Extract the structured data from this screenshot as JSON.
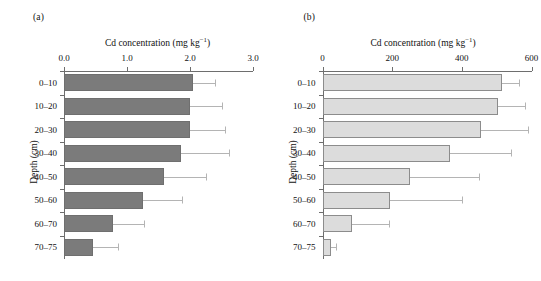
{
  "figure": {
    "axis_title_html": "Cd concentration (mg kg",
    "axis_title_sup": "−1",
    "axis_title_close": ")",
    "ylabel": "Depth (cm)",
    "depths": [
      "0–10",
      "10–20",
      "20–30",
      "30–40",
      "40–50",
      "50–60",
      "60–70",
      "70–75"
    ]
  },
  "panels": [
    {
      "letter": "(a)",
      "bar_color": "#7b7b7b",
      "border_color": "#6f6f6f",
      "tick_labels": [
        "0.0",
        "1.0",
        "2.0",
        "3.0"
      ]
    },
    {
      "letter": "(b)",
      "bar_color": "#dcdcdc",
      "border_color": "#8c8c8c",
      "tick_labels": [
        "0",
        "200",
        "400",
        "600"
      ]
    }
  ],
  "chart_data": [
    {
      "type": "bar",
      "orientation": "horizontal",
      "panel": "(a)",
      "title": "Cd concentration (mg kg−1)",
      "xlabel": "Cd concentration (mg kg−1)",
      "ylabel": "Depth (cm)",
      "categories": [
        "0–10",
        "10–20",
        "20–30",
        "30–40",
        "40–50",
        "50–60",
        "60–70",
        "70–75"
      ],
      "values": [
        2.05,
        2.0,
        2.0,
        1.85,
        1.58,
        1.26,
        0.77,
        0.46
      ],
      "error_upper": [
        2.4,
        2.5,
        2.55,
        2.62,
        2.25,
        1.88,
        1.27,
        0.86
      ],
      "xlim": [
        0.0,
        3.0
      ],
      "xticks": [
        0.0,
        1.0,
        2.0,
        3.0
      ],
      "grid": false,
      "legend": "none",
      "units": "mg kg−1"
    },
    {
      "type": "bar",
      "orientation": "horizontal",
      "panel": "(b)",
      "title": "Cd concentration (mg kg−1)",
      "xlabel": "Cd concentration (mg kg−1)",
      "ylabel": "Depth (cm)",
      "categories": [
        "0–10",
        "10–20",
        "20–30",
        "30–40",
        "40–50",
        "50–60",
        "60–70",
        "70–75"
      ],
      "values": [
        515,
        505,
        455,
        365,
        250,
        193,
        86,
        23
      ],
      "error_upper": [
        565,
        580,
        590,
        540,
        450,
        400,
        190,
        40
      ],
      "xlim": [
        0,
        600
      ],
      "xticks": [
        0,
        200,
        400,
        600
      ],
      "grid": false,
      "legend": "none",
      "units": "mg kg−1"
    }
  ]
}
